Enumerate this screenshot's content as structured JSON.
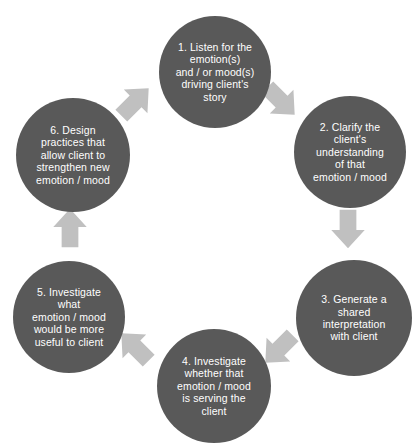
{
  "diagram": {
    "type": "cycle",
    "direction": "clockwise",
    "colors": {
      "node_fill": "#595959",
      "node_text": "#ffffff",
      "arrow_fill": "#c0c0c0",
      "background": "#ffffff"
    },
    "nodes": [
      {
        "id": "step-1",
        "number": "1",
        "label": "1. Listen for the\nemotion(s)\nand / or mood(s)\ndriving client's\nstory",
        "cx": 215,
        "cy": 72,
        "r": 56
      },
      {
        "id": "step-2",
        "number": "2",
        "label": "2. Clarify the\nclient's\nunderstanding\nof that\nemotion / mood",
        "cx": 350,
        "cy": 152,
        "r": 56
      },
      {
        "id": "step-3",
        "number": "3",
        "label": "3. Generate a\nshared\ninterpretation\nwith client",
        "cx": 354,
        "cy": 318,
        "r": 58
      },
      {
        "id": "step-4",
        "number": "4",
        "label": "4. Investigate\nwhether that\nemotion / mood\nis serving the\nclient",
        "cx": 214,
        "cy": 386,
        "r": 57
      },
      {
        "id": "step-5",
        "number": "5",
        "label": "5. Investigate\nwhat\nemotion / mood\nwould be more\nuseful to client",
        "cx": 69,
        "cy": 317,
        "r": 56
      },
      {
        "id": "step-6",
        "number": "6",
        "label": "6. Design\npractices that\nallow client to\nstrengthen new\nemotion / mood",
        "cx": 73,
        "cy": 155,
        "r": 57
      }
    ],
    "arrows": [
      {
        "id": "arrow-1-to-2",
        "from": "step-1",
        "to": "step-2",
        "direction": "down-right",
        "x": 259,
        "y": 79,
        "rotation": 135
      },
      {
        "id": "arrow-2-to-3",
        "from": "step-2",
        "to": "step-3",
        "direction": "down",
        "x": 326,
        "y": 207,
        "rotation": 180
      },
      {
        "id": "arrow-3-to-4",
        "from": "step-3",
        "to": "step-4",
        "direction": "down-left",
        "x": 257,
        "y": 327,
        "rotation": 225
      },
      {
        "id": "arrow-4-to-5",
        "from": "step-4",
        "to": "step-5",
        "direction": "up-left",
        "x": 113,
        "y": 325,
        "rotation": 315
      },
      {
        "id": "arrow-5-to-6",
        "from": "step-5",
        "to": "step-6",
        "direction": "up",
        "x": 48,
        "y": 206,
        "rotation": 0
      },
      {
        "id": "arrow-6-to-1",
        "from": "step-6",
        "to": "step-1",
        "direction": "up-right",
        "x": 113,
        "y": 80,
        "rotation": 45
      }
    ]
  }
}
